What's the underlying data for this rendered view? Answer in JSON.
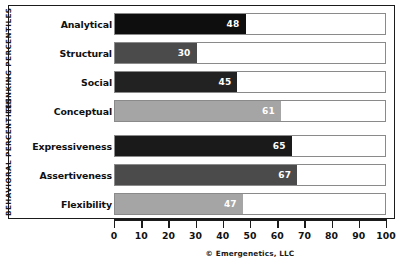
{
  "chart_data": {
    "type": "bar",
    "orientation": "horizontal",
    "title": "",
    "xlabel": "",
    "ylabel": "",
    "xlim": [
      0,
      100
    ],
    "xticks": [
      0,
      10,
      20,
      30,
      40,
      50,
      60,
      70,
      80,
      90,
      100
    ],
    "grid": false,
    "legend": null,
    "categories": [
      "Analytical",
      "Structural",
      "Social",
      "Conceptual",
      "Expressiveness",
      "Assertiveness",
      "Flexibility"
    ],
    "values": [
      48,
      30,
      45,
      61,
      65,
      67,
      47
    ],
    "bar_colors": [
      "#0e0e0e",
      "#4b4b4b",
      "#222222",
      "#a5a5a5",
      "#1a1a1a",
      "#4b4b4b",
      "#a5a5a5"
    ],
    "groups": [
      {
        "label": "THINKING PERCENTILES",
        "categories": [
          "Analytical",
          "Structural",
          "Social",
          "Conceptual"
        ]
      },
      {
        "label": "BEHAVIORAL PERCENTILES",
        "categories": [
          "Expressiveness",
          "Assertiveness",
          "Flexibility"
        ]
      }
    ],
    "annotations": [
      "© Emergenetics, LLC"
    ]
  },
  "axis": {
    "ticks": [
      "0",
      "10",
      "20",
      "30",
      "40",
      "50",
      "60",
      "70",
      "80",
      "90",
      "100"
    ]
  },
  "groups": {
    "thinking_label": "THINKING PERCENTILES",
    "behavioral_label": "BEHAVIORAL PERCENTILES"
  },
  "rows": [
    {
      "label": "Analytical",
      "value": "48",
      "color": "#0e0e0e"
    },
    {
      "label": "Structural",
      "value": "30",
      "color": "#4b4b4b"
    },
    {
      "label": "Social",
      "value": "45",
      "color": "#222222"
    },
    {
      "label": "Conceptual",
      "value": "61",
      "color": "#a5a5a5"
    },
    {
      "label": "Expressiveness",
      "value": "65",
      "color": "#1a1a1a"
    },
    {
      "label": "Assertiveness",
      "value": "67",
      "color": "#4b4b4b"
    },
    {
      "label": "Flexibility",
      "value": "47",
      "color": "#a5a5a5"
    }
  ],
  "footer": {
    "copyright": "© Emergenetics, LLC"
  }
}
